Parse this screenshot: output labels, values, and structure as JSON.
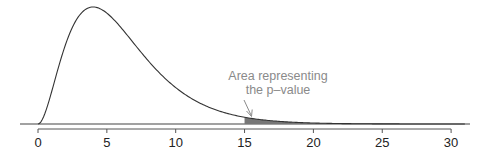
{
  "chart_data": {
    "type": "area",
    "title": "",
    "subtitle": "",
    "xlabel": "",
    "ylabel": "",
    "distribution": "chi-square",
    "df": 6,
    "xlim": [
      -1,
      31
    ],
    "xticks": [
      0,
      5,
      10,
      15,
      20,
      25,
      30
    ],
    "xtick_labels": [
      "0",
      "5",
      "10",
      "15",
      "20",
      "25",
      "30"
    ],
    "y_axis_shown": false,
    "grid": false,
    "legend": null,
    "shaded_region": {
      "from": 15,
      "to": 30,
      "color": "#777777",
      "meaning": "p-value"
    },
    "curve_points_sample": [
      {
        "x": 0,
        "y": 0.0
      },
      {
        "x": 1,
        "y": 0.038
      },
      {
        "x": 2,
        "y": 0.092
      },
      {
        "x": 3,
        "y": 0.126
      },
      {
        "x": 4,
        "y": 0.135
      },
      {
        "x": 5,
        "y": 0.128
      },
      {
        "x": 6,
        "y": 0.112
      },
      {
        "x": 8,
        "y": 0.073
      },
      {
        "x": 10,
        "y": 0.042
      },
      {
        "x": 12,
        "y": 0.022
      },
      {
        "x": 15,
        "y": 0.0066
      },
      {
        "x": 20,
        "y": 0.0011
      },
      {
        "x": 25,
        "y": 0.0001
      },
      {
        "x": 30,
        "y": 0.0
      }
    ],
    "annotations": [
      {
        "text_lines": [
          "Area representing",
          "the p–value"
        ],
        "arrow_to_x": 15.5,
        "color": "#8a8a8a"
      }
    ]
  },
  "annotation": {
    "line1": "Area representing",
    "line2": "the p–value"
  },
  "axis": {
    "ticks": [
      "0",
      "5",
      "10",
      "15",
      "20",
      "25",
      "30"
    ]
  },
  "colors": {
    "curve": "#333333",
    "shade": "#777777",
    "annotation": "#8a8a8a",
    "axis": "#555555"
  }
}
